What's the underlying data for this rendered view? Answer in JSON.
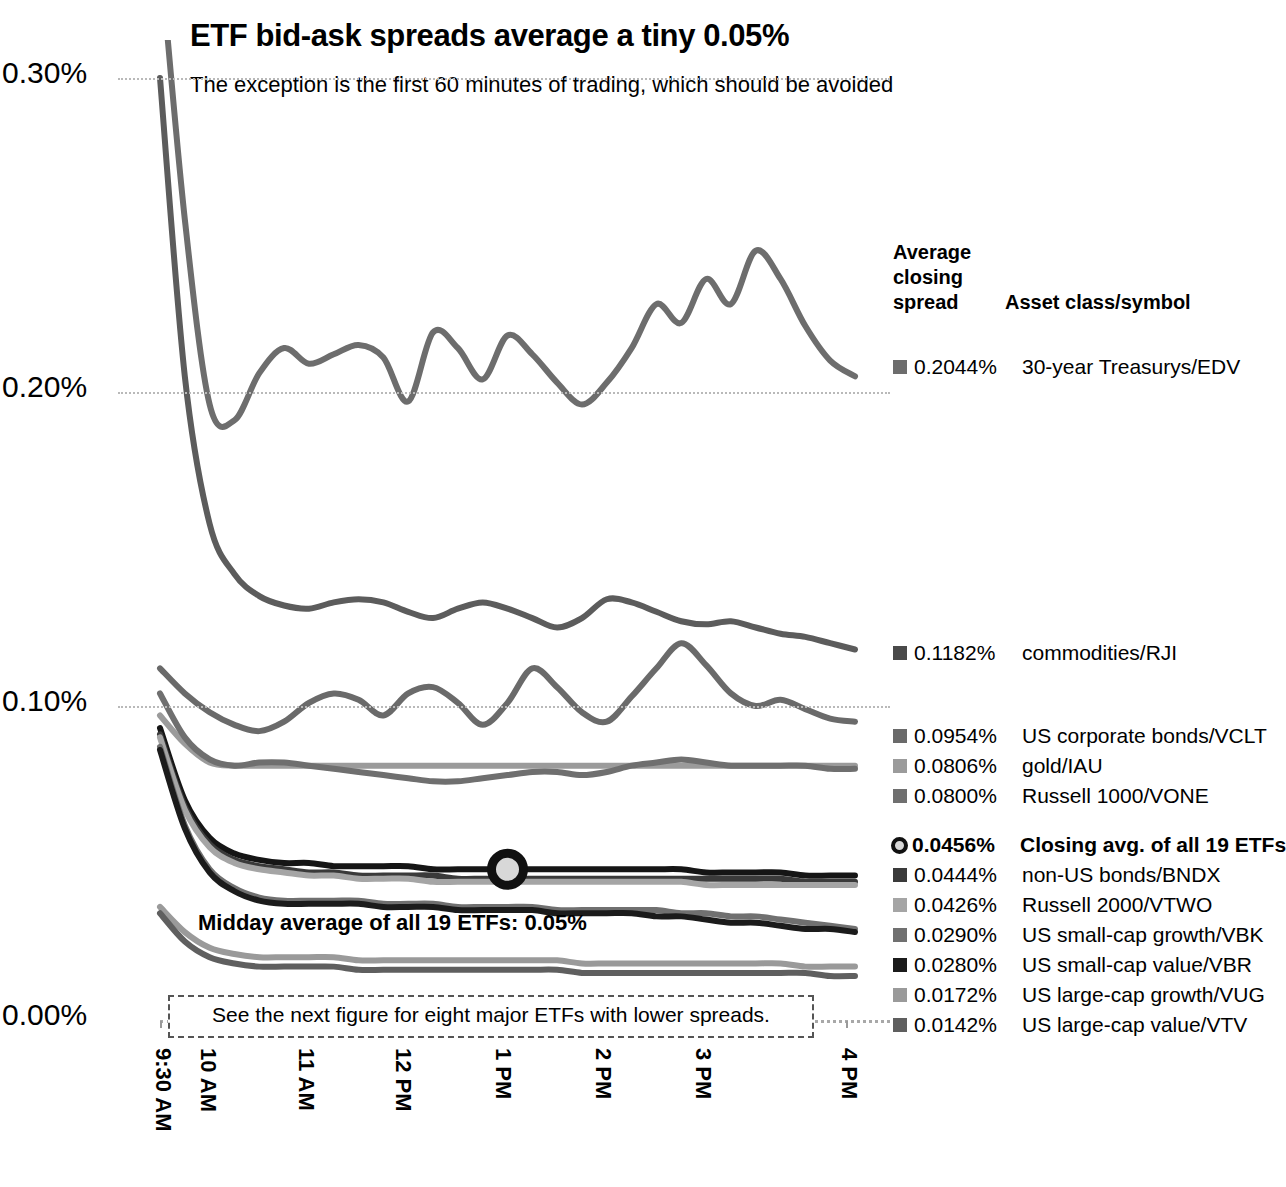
{
  "header": {
    "title": "ETF bid-ask spreads average a tiny 0.05%",
    "subtitle": "The exception is the first 60 minutes of trading, which should be avoided"
  },
  "annotations": {
    "midday_note": "Midday average of all 19 ETFs: 0.05%",
    "next_figure_note": "See the next figure for eight major ETFs with lower spreads."
  },
  "legend": {
    "header_line1": "Average",
    "header_line2": "closing",
    "header_line3": "spread",
    "header_col2": "Asset class/symbol"
  },
  "chart_data": {
    "type": "line",
    "title": "ETF bid-ask spreads average a tiny 0.05%",
    "subtitle": "The exception is the first 60 minutes of trading, which should be avoided",
    "xlabel": "",
    "ylabel": "",
    "ylim": [
      0.0,
      0.3
    ],
    "yticks": [
      "0.00%",
      "0.10%",
      "0.20%",
      "0.30%"
    ],
    "ytick_values": [
      0.0,
      0.1,
      0.2,
      0.3
    ],
    "xticks": [
      "9:30 AM",
      "10 AM",
      "11 AM",
      "12 PM",
      "1 PM",
      "2 PM",
      "3 PM",
      "4 PM"
    ],
    "grid": "horizontal-dotted",
    "legend_position": "right",
    "series": [
      {
        "name": "30-year Treasurys/EDV",
        "closing_spread": "0.2044%",
        "color": "#6d6d6d",
        "values": [
          0.34,
          0.255,
          0.196,
          0.191,
          0.206,
          0.214,
          0.209,
          0.212,
          0.215,
          0.211,
          0.197,
          0.219,
          0.214,
          0.204,
          0.218,
          0.212,
          0.203,
          0.196,
          0.203,
          0.214,
          0.228,
          0.222,
          0.236,
          0.228,
          0.245,
          0.236,
          0.221,
          0.21,
          0.205
        ]
      },
      {
        "name": "commodities/RJI",
        "closing_spread": "0.1182%",
        "color": "#5c5c5c",
        "values": [
          0.3,
          0.205,
          0.158,
          0.142,
          0.135,
          0.132,
          0.131,
          0.133,
          0.134,
          0.133,
          0.13,
          0.128,
          0.131,
          0.133,
          0.131,
          0.128,
          0.125,
          0.128,
          0.134,
          0.133,
          0.13,
          0.127,
          0.126,
          0.127,
          0.125,
          0.123,
          0.122,
          0.12,
          0.118
        ]
      },
      {
        "name": "US corporate bonds/VCLT",
        "closing_spread": "0.0954%",
        "color": "#6a6a6a",
        "values": [
          0.112,
          0.104,
          0.098,
          0.094,
          0.092,
          0.095,
          0.101,
          0.104,
          0.102,
          0.097,
          0.104,
          0.106,
          0.101,
          0.094,
          0.101,
          0.112,
          0.106,
          0.098,
          0.095,
          0.103,
          0.112,
          0.12,
          0.113,
          0.104,
          0.1,
          0.102,
          0.099,
          0.096,
          0.095
        ]
      },
      {
        "name": "gold/IAU",
        "closing_spread": "0.0806%",
        "color": "#9b9b9b",
        "values": [
          0.097,
          0.088,
          0.082,
          0.081,
          0.081,
          0.081,
          0.081,
          0.081,
          0.081,
          0.081,
          0.081,
          0.081,
          0.081,
          0.081,
          0.081,
          0.081,
          0.081,
          0.081,
          0.081,
          0.081,
          0.081,
          0.081,
          0.081,
          0.081,
          0.081,
          0.081,
          0.081,
          0.081,
          0.081
        ]
      },
      {
        "name": "Russell 1000/VONE",
        "closing_spread": "0.0800%",
        "color": "#6f6f6f",
        "values": [
          0.104,
          0.09,
          0.083,
          0.081,
          0.082,
          0.082,
          0.081,
          0.08,
          0.079,
          0.078,
          0.077,
          0.076,
          0.076,
          0.077,
          0.078,
          0.079,
          0.079,
          0.078,
          0.079,
          0.081,
          0.082,
          0.083,
          0.082,
          0.081,
          0.081,
          0.081,
          0.081,
          0.08,
          0.08
        ]
      },
      {
        "name": "Closing avg. of all 19 ETFs",
        "closing_spread": "0.0456%",
        "color": "#151515",
        "values": [
          0.093,
          0.07,
          0.058,
          0.053,
          0.051,
          0.05,
          0.05,
          0.049,
          0.049,
          0.049,
          0.049,
          0.048,
          0.048,
          0.048,
          0.048,
          0.048,
          0.048,
          0.048,
          0.048,
          0.048,
          0.048,
          0.048,
          0.047,
          0.047,
          0.047,
          0.047,
          0.046,
          0.046,
          0.046
        ]
      },
      {
        "name": "non-US bonds/BNDX",
        "closing_spread": "0.0444%",
        "color": "#3a3a3a",
        "values": [
          0.091,
          0.068,
          0.056,
          0.051,
          0.049,
          0.048,
          0.047,
          0.047,
          0.046,
          0.046,
          0.046,
          0.046,
          0.045,
          0.045,
          0.045,
          0.045,
          0.045,
          0.045,
          0.045,
          0.045,
          0.045,
          0.045,
          0.045,
          0.045,
          0.045,
          0.045,
          0.044,
          0.044,
          0.044
        ]
      },
      {
        "name": "Russell 2000/VTWO",
        "closing_spread": "0.0426%",
        "color": "#a5a5a5",
        "values": [
          0.09,
          0.067,
          0.055,
          0.05,
          0.048,
          0.047,
          0.046,
          0.046,
          0.045,
          0.045,
          0.045,
          0.044,
          0.044,
          0.044,
          0.044,
          0.044,
          0.044,
          0.044,
          0.044,
          0.044,
          0.044,
          0.044,
          0.043,
          0.043,
          0.043,
          0.043,
          0.043,
          0.043,
          0.043
        ]
      },
      {
        "name": "US small-cap growth/VBK",
        "closing_spread": "0.0290%",
        "color": "#707070",
        "values": [
          0.087,
          0.062,
          0.048,
          0.042,
          0.039,
          0.038,
          0.038,
          0.038,
          0.038,
          0.037,
          0.037,
          0.037,
          0.036,
          0.036,
          0.036,
          0.036,
          0.035,
          0.035,
          0.035,
          0.035,
          0.035,
          0.034,
          0.034,
          0.033,
          0.033,
          0.032,
          0.031,
          0.03,
          0.029
        ]
      },
      {
        "name": "US small-cap value/VBR",
        "closing_spread": "0.0280%",
        "color": "#1b1b1b",
        "values": [
          0.086,
          0.061,
          0.047,
          0.041,
          0.038,
          0.037,
          0.037,
          0.037,
          0.037,
          0.036,
          0.036,
          0.036,
          0.035,
          0.035,
          0.035,
          0.035,
          0.034,
          0.034,
          0.034,
          0.034,
          0.033,
          0.033,
          0.032,
          0.031,
          0.031,
          0.03,
          0.029,
          0.029,
          0.028
        ]
      },
      {
        "name": "US large-cap growth/VUG",
        "closing_spread": "0.0172%",
        "color": "#9a9a9a",
        "values": [
          0.036,
          0.028,
          0.023,
          0.021,
          0.02,
          0.02,
          0.02,
          0.02,
          0.019,
          0.019,
          0.019,
          0.019,
          0.019,
          0.019,
          0.019,
          0.019,
          0.019,
          0.018,
          0.018,
          0.018,
          0.018,
          0.018,
          0.018,
          0.018,
          0.018,
          0.018,
          0.017,
          0.017,
          0.017
        ]
      },
      {
        "name": "US large-cap value/VTV",
        "closing_spread": "0.0142%",
        "color": "#5f5f5f",
        "values": [
          0.034,
          0.025,
          0.02,
          0.018,
          0.017,
          0.017,
          0.017,
          0.017,
          0.016,
          0.016,
          0.016,
          0.016,
          0.016,
          0.016,
          0.016,
          0.016,
          0.016,
          0.015,
          0.015,
          0.015,
          0.015,
          0.015,
          0.015,
          0.015,
          0.015,
          0.015,
          0.015,
          0.014,
          0.014
        ]
      }
    ],
    "marker": {
      "label": "Midday average of all 19 ETFs: 0.05%",
      "x_index": 14,
      "value": 0.048
    }
  },
  "legend_rows": [
    {
      "value": "0.2044%",
      "label": "30-year Treasurys/EDV",
      "color": "#6d6d6d",
      "top": 355,
      "bold": false,
      "ring": false
    },
    {
      "value": "0.1182%",
      "label": "commodities/RJI",
      "color": "#4a4a4a",
      "top": 641,
      "bold": false,
      "ring": false
    },
    {
      "value": "0.0954%",
      "label": "US corporate bonds/VCLT",
      "color": "#6a6a6a",
      "top": 724,
      "bold": false,
      "ring": false
    },
    {
      "value": "0.0806%",
      "label": "gold/IAU",
      "color": "#9b9b9b",
      "top": 754,
      "bold": false,
      "ring": false
    },
    {
      "value": "0.0800%",
      "label": "Russell 1000/VONE",
      "color": "#6f6f6f",
      "top": 784,
      "bold": false,
      "ring": false
    },
    {
      "value": "0.0456%",
      "label": "Closing avg. of all 19 ETFs",
      "color": "#111111",
      "top": 833,
      "bold": true,
      "ring": true
    },
    {
      "value": "0.0444%",
      "label": "non-US bonds/BNDX",
      "color": "#3a3a3a",
      "top": 863,
      "bold": false,
      "ring": false
    },
    {
      "value": "0.0426%",
      "label": "Russell 2000/VTWO",
      "color": "#a5a5a5",
      "top": 893,
      "bold": false,
      "ring": false
    },
    {
      "value": "0.0290%",
      "label": "US small-cap growth/VBK",
      "color": "#707070",
      "top": 923,
      "bold": false,
      "ring": false
    },
    {
      "value": "0.0280%",
      "label": "US small-cap value/VBR",
      "color": "#1b1b1b",
      "top": 953,
      "bold": false,
      "ring": false
    },
    {
      "value": "0.0172%",
      "label": "US large-cap growth/VUG",
      "color": "#9a9a9a",
      "top": 983,
      "bold": false,
      "ring": false
    },
    {
      "value": "0.0142%",
      "label": "US large-cap value/VTV",
      "color": "#5f5f5f",
      "top": 1013,
      "bold": false,
      "ring": false
    }
  ]
}
